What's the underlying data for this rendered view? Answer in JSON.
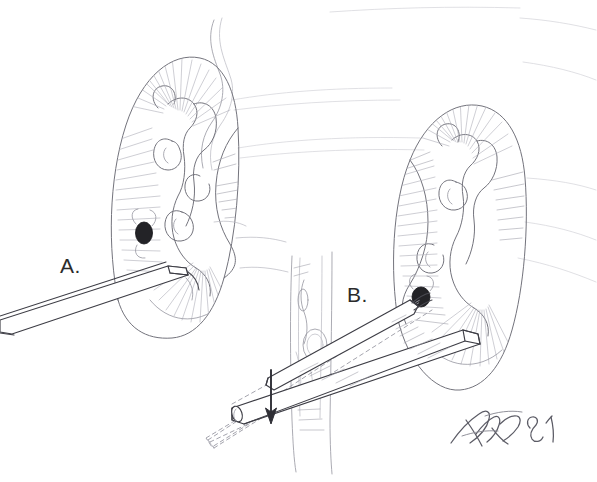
{
  "figure": {
    "medium": "graphite pencil line drawing",
    "background_color": "#ffffff",
    "ink_color": "#6b6b73",
    "dark_ink_color": "#2b2b2b",
    "stone_color": "#1f1f22",
    "width": 597,
    "height": 482
  },
  "panels": [
    {
      "id": "panel-a",
      "label": "A.",
      "label_x": 60,
      "label_y": 255,
      "description": "Left kidney coronal section with a nephroscope sheath entering the lower pole toward a calyceal stone"
    },
    {
      "id": "panel-b",
      "label": "B.",
      "label_x": 347,
      "label_y": 284,
      "description": "Right kidney coronal section with the sheath angled upward, tip engaging the stone; dashed ghost outline and arrow indicate repositioning"
    }
  ],
  "annotations": {
    "signature": "artist signature",
    "signature_year": "81",
    "arrow": {
      "name": "direction-arrow",
      "meaning": "downward repositioning of the instrument shaft"
    },
    "dashed_guide": {
      "name": "dashed-guide-lines",
      "meaning": "prior / alternate instrument trajectory"
    }
  },
  "anatomy": {
    "left_kidney": {
      "name": "left-kidney",
      "features": [
        "renal cortex",
        "medullary pyramids",
        "renal pelvis",
        "minor calyces",
        "calyceal stone"
      ]
    },
    "right_kidney": {
      "name": "right-kidney",
      "features": [
        "renal cortex",
        "medullary pyramids",
        "renal pelvis",
        "minor calyces",
        "calyceal stone"
      ]
    },
    "spine": {
      "name": "vertebral-column",
      "features": [
        "vertebral bodies",
        "great vessels",
        "aorta",
        "vena cava"
      ]
    },
    "ribs": {
      "name": "rib-lines",
      "count": 4
    },
    "ureter": {
      "name": "ureter-and-vessel",
      "description": "curving tubular structure ascending above the left kidney"
    }
  },
  "instruments": [
    {
      "name": "nephroscope-sheath-a",
      "description": "straight beveled rigid sheath entering from lower-left toward left kidney hilum"
    },
    {
      "name": "nephroscope-sheath-b",
      "description": "straight beveled rigid sheath angled up-right with tip at stone in right kidney"
    },
    {
      "name": "nephroscope-sheath-b-ghost",
      "description": "dashed outline of the sheath in a lower starting position"
    }
  ]
}
